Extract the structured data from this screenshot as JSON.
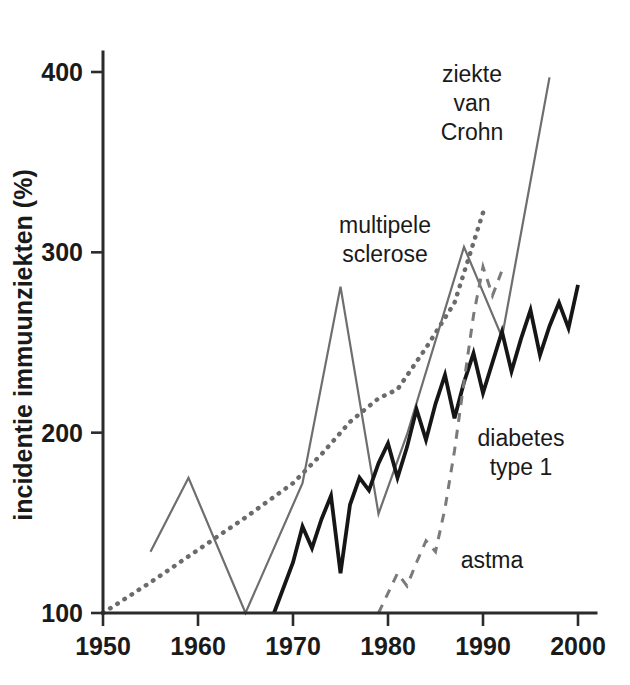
{
  "figure": {
    "background_color": "#ffffff",
    "axis_color": "#2b2b2b"
  },
  "chart_data": {
    "type": "line",
    "title": "",
    "subtitle": "",
    "xlabel": "",
    "ylabel": "incidentie immuunziekten (%)",
    "xlim": [
      1950,
      2000
    ],
    "ylim": [
      100,
      420
    ],
    "x_ticks": [
      1950,
      1960,
      1970,
      1980,
      1990,
      2000
    ],
    "x_tick_labels": [
      "1950",
      "1960",
      "1970",
      "1980",
      "1990",
      "2000"
    ],
    "y_ticks": [
      100,
      200,
      300,
      400
    ],
    "y_tick_labels": [
      "100",
      "200",
      "300",
      "400"
    ],
    "grid": false,
    "legend": "inline-annotations",
    "series": [
      {
        "name": "multipele sclerose",
        "label_lines": [
          "multipele",
          "sclerose"
        ],
        "style": "dotted",
        "color": "#6b6b6b",
        "width": 4.5,
        "dasharray": "0.5 8",
        "label_x": 1990,
        "label_y": 322,
        "label_px": [
          385,
          213
        ],
        "points": [
          [
            1950,
            100
          ],
          [
            1955,
            117
          ],
          [
            1960,
            135
          ],
          [
            1965,
            153
          ],
          [
            1970,
            172
          ],
          [
            1973,
            188
          ],
          [
            1976,
            206
          ],
          [
            1979,
            219
          ],
          [
            1981,
            224
          ],
          [
            1984,
            247
          ],
          [
            1987,
            272
          ],
          [
            1990,
            322
          ]
        ]
      },
      {
        "name": "ziekte van Crohn",
        "label_lines": [
          "ziekte",
          "van",
          "Crohn"
        ],
        "style": "solid",
        "color": "#6e6e6e",
        "width": 2.2,
        "dasharray": "",
        "label_x": 1992,
        "label_y": 390,
        "label_px": [
          472,
          62
        ],
        "points": [
          [
            1955,
            134
          ],
          [
            1959,
            175
          ],
          [
            1965,
            100
          ],
          [
            1971,
            172
          ],
          [
            1975,
            281
          ],
          [
            1979,
            155
          ],
          [
            1982,
            199
          ],
          [
            1988,
            303
          ],
          [
            1992,
            253
          ],
          [
            1997,
            397
          ]
        ]
      },
      {
        "name": "diabetes type 1",
        "label_lines": [
          "diabetes",
          "type 1"
        ],
        "style": "solid",
        "color": "#161616",
        "width": 3.8,
        "dasharray": "",
        "label_x": 1994,
        "label_y": 212,
        "label_px": [
          521,
          426
        ],
        "points": [
          [
            1968,
            100
          ],
          [
            1970,
            128
          ],
          [
            1971,
            148
          ],
          [
            1972,
            136
          ],
          [
            1973,
            152
          ],
          [
            1974,
            165
          ],
          [
            1975,
            122
          ],
          [
            1976,
            160
          ],
          [
            1977,
            175
          ],
          [
            1978,
            168
          ],
          [
            1979,
            183
          ],
          [
            1980,
            194
          ],
          [
            1981,
            175
          ],
          [
            1982,
            192
          ],
          [
            1983,
            213
          ],
          [
            1984,
            196
          ],
          [
            1985,
            216
          ],
          [
            1986,
            232
          ],
          [
            1987,
            208
          ],
          [
            1988,
            228
          ],
          [
            1989,
            244
          ],
          [
            1990,
            222
          ],
          [
            1991,
            239
          ],
          [
            1992,
            256
          ],
          [
            1993,
            234
          ],
          [
            1994,
            252
          ],
          [
            1995,
            268
          ],
          [
            1996,
            243
          ],
          [
            1997,
            259
          ],
          [
            1998,
            272
          ],
          [
            1999,
            258
          ],
          [
            2000,
            282
          ]
        ]
      },
      {
        "name": "astma",
        "label_lines": [
          "astma"
        ],
        "style": "dashed",
        "color": "#7a7a7a",
        "width": 3.0,
        "dasharray": "9 8",
        "label_x": 1987,
        "label_y": 143,
        "label_px": [
          492,
          548
        ],
        "points": [
          [
            1979,
            100
          ],
          [
            1981,
            122
          ],
          [
            1982,
            115
          ],
          [
            1983,
            128
          ],
          [
            1984,
            140
          ],
          [
            1985,
            134
          ],
          [
            1986,
            158
          ],
          [
            1987,
            190
          ],
          [
            1988,
            228
          ],
          [
            1989,
            265
          ],
          [
            1990,
            292
          ],
          [
            1991,
            276
          ],
          [
            1992,
            290
          ]
        ]
      }
    ]
  }
}
